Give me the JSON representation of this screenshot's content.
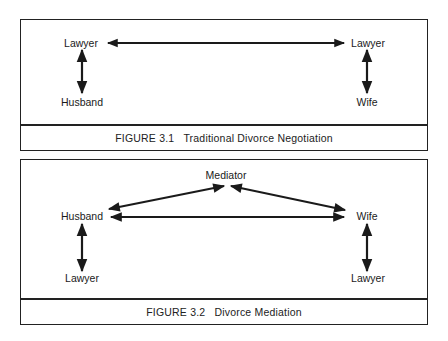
{
  "figures": [
    {
      "number": "FIGURE 3.1",
      "title": "Traditional Divorce Negotiation",
      "nodes": {
        "left_top": "Lawyer",
        "left_bottom": "Husband",
        "right_top": "Lawyer",
        "right_bottom": "Wife"
      },
      "edges": [
        {
          "from": "Lawyer (left)",
          "to": "Lawyer (right)",
          "type": "bidirectional"
        },
        {
          "from": "Lawyer (left)",
          "to": "Husband",
          "type": "bidirectional"
        },
        {
          "from": "Lawyer (right)",
          "to": "Wife",
          "type": "bidirectional"
        }
      ]
    },
    {
      "number": "FIGURE 3.2",
      "title": "Divorce Mediation",
      "nodes": {
        "top": "Mediator",
        "left_top": "Husband",
        "left_bottom": "Lawyer",
        "right_top": "Wife",
        "right_bottom": "Lawyer"
      },
      "edges": [
        {
          "from": "Husband",
          "to": "Mediator",
          "type": "bidirectional"
        },
        {
          "from": "Mediator",
          "to": "Wife",
          "type": "bidirectional"
        },
        {
          "from": "Husband",
          "to": "Wife",
          "type": "bidirectional"
        },
        {
          "from": "Husband",
          "to": "Lawyer (left)",
          "type": "bidirectional"
        },
        {
          "from": "Wife",
          "to": "Lawyer (right)",
          "type": "bidirectional"
        }
      ]
    }
  ],
  "colors": {
    "ink": "#1a1a1a",
    "paper": "#ffffff"
  }
}
